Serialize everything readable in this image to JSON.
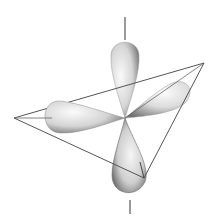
{
  "diagram": {
    "title": "",
    "type": "sp3 hybrid orbitals with tetrahedral frame",
    "background": "#ffffff",
    "center": [
      125,
      118
    ],
    "lobes": [
      {
        "name": "top-lobe",
        "direction": "up"
      },
      {
        "name": "right-lobe",
        "direction": "upper-right"
      },
      {
        "name": "left-lobe",
        "direction": "left"
      },
      {
        "name": "bottom-lobe",
        "direction": "down"
      }
    ],
    "tetrahedron_vertices": {
      "left": [
        14,
        118
      ],
      "right": [
        204,
        63
      ],
      "bottom": [
        144,
        178
      ]
    },
    "colors": {
      "lobe_light": "#f4f4f4",
      "lobe_dark": "#4a4a4a",
      "line": "#555555"
    }
  }
}
